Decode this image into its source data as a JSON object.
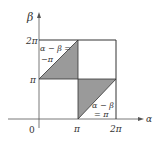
{
  "diagram": {
    "axes": {
      "x_label": "α",
      "y_label": "β",
      "origin_label": "0"
    },
    "x_ticks": [
      "π",
      "2π"
    ],
    "y_ticks": [
      "π",
      "2π"
    ],
    "annotations": [
      {
        "line1": "α − β =",
        "line2": "−π"
      },
      {
        "line1": "α − β",
        "line2": "= π"
      }
    ],
    "colors": {
      "shade": "#999999",
      "line": "#444444"
    }
  }
}
